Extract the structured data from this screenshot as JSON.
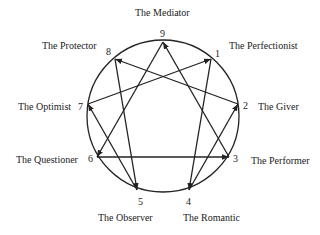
{
  "diagram": {
    "type": "enneagram",
    "types": [
      {
        "number": "1",
        "name": "The Perfectionist"
      },
      {
        "number": "2",
        "name": "The Giver"
      },
      {
        "number": "3",
        "name": "The Performer"
      },
      {
        "number": "4",
        "name": "The Romantic"
      },
      {
        "number": "5",
        "name": "The Observer"
      },
      {
        "number": "6",
        "name": "The Questioner"
      },
      {
        "number": "7",
        "name": "The Optimist"
      },
      {
        "number": "8",
        "name": "The Protector"
      },
      {
        "number": "9",
        "name": "The Mediator"
      }
    ],
    "arrows": [
      {
        "from": "2",
        "to": "8"
      },
      {
        "from": "3",
        "to": "9"
      },
      {
        "from": "7",
        "to": "1"
      },
      {
        "from": "4",
        "to": "2"
      },
      {
        "from": "5",
        "to": "7"
      },
      {
        "from": "9",
        "to": "6"
      },
      {
        "from": "8",
        "to": "5"
      },
      {
        "from": "6",
        "to": "3"
      },
      {
        "from": "1",
        "to": "4"
      }
    ],
    "line_color": "#222222"
  }
}
